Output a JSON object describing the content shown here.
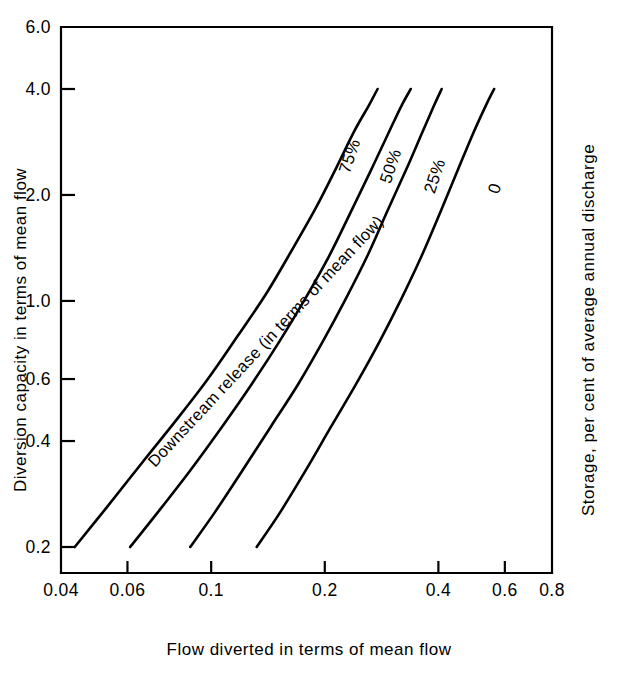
{
  "chart_data": {
    "type": "line",
    "title": "",
    "subtitle": "",
    "xlabel": "Flow diverted in terms of mean flow",
    "ylabel": "Diversion capacity in terms of mean flow",
    "y2label": "Storage, per cent of average annual discharge",
    "xscale": "log",
    "yscale": "log",
    "xlim": [
      0.04,
      0.8
    ],
    "ylim": [
      0.2,
      6.0
    ],
    "grid": false,
    "legend_position": "inline-curve-labels",
    "xticks": [
      0.04,
      0.06,
      0.1,
      0.2,
      0.4,
      0.6,
      0.8
    ],
    "xticklabels": [
      "0.04",
      "0.06",
      "0.1",
      "0.2",
      "0.4",
      "0.6",
      "0.8"
    ],
    "yticks": [
      0.2,
      0.4,
      0.6,
      1.0,
      2.0,
      4.0,
      6.0
    ],
    "yticklabels": [
      "0.2",
      "0.4",
      "0.6",
      "1.0",
      "2.0",
      "4.0",
      "6.0"
    ],
    "annotations": [
      {
        "text": "Downstream release (in terms of mean flow)",
        "rotation": -47,
        "x_px": 155,
        "y_px": 468
      }
    ],
    "series": [
      {
        "name": "75%",
        "label": "75%",
        "label_rotation": -72,
        "label_x_px": 355,
        "label_y_px": 158,
        "points": [
          {
            "x": 0.0435,
            "y": 0.2
          },
          {
            "x": 0.053,
            "y": 0.26
          },
          {
            "x": 0.066,
            "y": 0.35
          },
          {
            "x": 0.081,
            "y": 0.46
          },
          {
            "x": 0.098,
            "y": 0.6
          },
          {
            "x": 0.118,
            "y": 0.8
          },
          {
            "x": 0.14,
            "y": 1.05
          },
          {
            "x": 0.164,
            "y": 1.4
          },
          {
            "x": 0.19,
            "y": 1.85
          },
          {
            "x": 0.215,
            "y": 2.4
          },
          {
            "x": 0.24,
            "y": 3.05
          },
          {
            "x": 0.262,
            "y": 3.6
          },
          {
            "x": 0.276,
            "y": 4.0
          }
        ]
      },
      {
        "name": "50%",
        "label": "50%",
        "label_rotation": -72,
        "label_x_px": 396,
        "label_y_px": 168,
        "points": [
          {
            "x": 0.061,
            "y": 0.2
          },
          {
            "x": 0.072,
            "y": 0.25
          },
          {
            "x": 0.088,
            "y": 0.33
          },
          {
            "x": 0.107,
            "y": 0.44
          },
          {
            "x": 0.128,
            "y": 0.58
          },
          {
            "x": 0.152,
            "y": 0.77
          },
          {
            "x": 0.178,
            "y": 1.02
          },
          {
            "x": 0.206,
            "y": 1.35
          },
          {
            "x": 0.235,
            "y": 1.8
          },
          {
            "x": 0.265,
            "y": 2.35
          },
          {
            "x": 0.295,
            "y": 3.0
          },
          {
            "x": 0.32,
            "y": 3.6
          },
          {
            "x": 0.338,
            "y": 4.0
          }
        ]
      },
      {
        "name": "25%",
        "label": "25%",
        "label_rotation": -72,
        "label_x_px": 440,
        "label_y_px": 178,
        "points": [
          {
            "x": 0.088,
            "y": 0.2
          },
          {
            "x": 0.102,
            "y": 0.25
          },
          {
            "x": 0.121,
            "y": 0.33
          },
          {
            "x": 0.144,
            "y": 0.44
          },
          {
            "x": 0.17,
            "y": 0.58
          },
          {
            "x": 0.198,
            "y": 0.77
          },
          {
            "x": 0.228,
            "y": 1.02
          },
          {
            "x": 0.26,
            "y": 1.35
          },
          {
            "x": 0.293,
            "y": 1.8
          },
          {
            "x": 0.328,
            "y": 2.35
          },
          {
            "x": 0.362,
            "y": 3.0
          },
          {
            "x": 0.39,
            "y": 3.6
          },
          {
            "x": 0.408,
            "y": 4.0
          }
        ]
      },
      {
        "name": "0",
        "label": "0",
        "label_rotation": -72,
        "label_x_px": 500,
        "label_y_px": 190,
        "points": [
          {
            "x": 0.132,
            "y": 0.2
          },
          {
            "x": 0.152,
            "y": 0.25
          },
          {
            "x": 0.178,
            "y": 0.33
          },
          {
            "x": 0.208,
            "y": 0.44
          },
          {
            "x": 0.242,
            "y": 0.58
          },
          {
            "x": 0.28,
            "y": 0.77
          },
          {
            "x": 0.32,
            "y": 1.02
          },
          {
            "x": 0.362,
            "y": 1.35
          },
          {
            "x": 0.406,
            "y": 1.8
          },
          {
            "x": 0.45,
            "y": 2.35
          },
          {
            "x": 0.495,
            "y": 3.0
          },
          {
            "x": 0.535,
            "y": 3.6
          },
          {
            "x": 0.562,
            "y": 4.0
          }
        ]
      }
    ]
  },
  "colors": {
    "background": "#ffffff",
    "ink": "#000000"
  }
}
